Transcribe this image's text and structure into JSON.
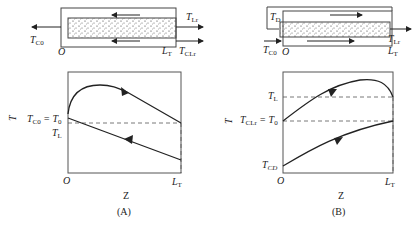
{
  "panels": [
    {
      "id": "A",
      "caption": "(A)",
      "schematic": {
        "inlet_label_T": "T",
        "inlet_label_sub": "C0",
        "origin": "O",
        "length_label_T": "L",
        "length_label_sub": "T",
        "outlet_top_T": "T",
        "outlet_top_sub": "Lr",
        "outlet_bottom_T": "T",
        "outlet_bottom_sub": "CLr",
        "flow_direction": "countercurrent (coolant right-to-left)"
      },
      "axes": {
        "ylabel": "T",
        "xlabel": "Z",
        "x_origin": "O",
        "x_end_T": "L",
        "x_end_sub": "T",
        "ytick1_main": "T",
        "ytick1_sub": "C0",
        "ytick1_eq": " = T",
        "ytick1_sub2": "0",
        "ytick2_main": "T",
        "ytick2_sub": "L"
      }
    },
    {
      "id": "B",
      "caption": "(B)",
      "schematic": {
        "inlet_label_T": "T",
        "inlet_label_sub": "C0",
        "recycle_label_T": "T",
        "recycle_label_sub": "D",
        "origin": "O",
        "length_label_T": "L",
        "length_label_sub": "T",
        "outlet_T": "T",
        "outlet_sub": "Lr",
        "flow_direction": "cocurrent (left-to-right)"
      },
      "axes": {
        "ylabel": "T",
        "xlabel": "Z",
        "x_origin": "O",
        "x_end_T": "L",
        "x_end_sub": "T",
        "ytick1_main": "T",
        "ytick1_sub": "L",
        "ytick2_main": "T",
        "ytick2_sub": "CLr",
        "ytick2_eq": " = T",
        "ytick2_sub2": "0",
        "ytick3_main": "T",
        "ytick3_sub": "CD"
      }
    }
  ]
}
